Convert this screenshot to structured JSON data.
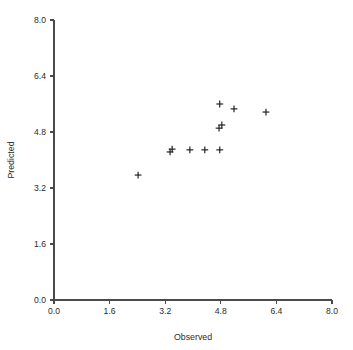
{
  "chart_data": {
    "type": "scatter",
    "title": "",
    "xlabel": "Observed",
    "ylabel": "Predicted",
    "xlim": [
      0.0,
      8.0
    ],
    "ylim": [
      0.0,
      8.0
    ],
    "xticks": [
      "0.0",
      "1.6",
      "3.2",
      "4.8",
      "6.4",
      "8.0"
    ],
    "yticks": [
      "0.0",
      "1.6",
      "3.2",
      "4.8",
      "6.4",
      "8.0"
    ],
    "xtick_values": [
      0.0,
      1.6,
      3.2,
      4.8,
      6.4,
      8.0
    ],
    "ytick_values": [
      0.0,
      1.6,
      3.2,
      4.8,
      6.4,
      8.0
    ],
    "grid": false,
    "legend": false,
    "marker": "plus",
    "marker_color": "#1a1a1a",
    "points": [
      {
        "x": 2.42,
        "y": 3.57
      },
      {
        "x": 3.34,
        "y": 4.23
      },
      {
        "x": 3.4,
        "y": 4.31
      },
      {
        "x": 3.91,
        "y": 4.29
      },
      {
        "x": 4.34,
        "y": 4.29
      },
      {
        "x": 4.77,
        "y": 4.29
      },
      {
        "x": 4.75,
        "y": 4.91
      },
      {
        "x": 4.83,
        "y": 5.0
      },
      {
        "x": 4.77,
        "y": 5.6
      },
      {
        "x": 5.18,
        "y": 5.46
      },
      {
        "x": 6.1,
        "y": 5.37
      }
    ],
    "x": [
      2.42,
      3.34,
      3.4,
      3.91,
      4.34,
      4.77,
      4.75,
      4.83,
      4.77,
      5.18,
      6.1
    ],
    "values": [
      3.57,
      4.23,
      4.31,
      4.29,
      4.29,
      4.29,
      4.91,
      5.0,
      5.6,
      5.46,
      5.37
    ]
  },
  "axes": {
    "x_label": "Observed",
    "y_label": "Predicted"
  }
}
